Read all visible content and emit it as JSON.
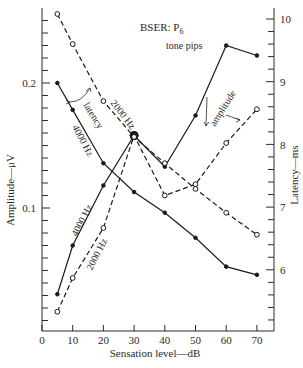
{
  "chart_data": {
    "type": "line",
    "title": "BSER: P6",
    "title_main": "BSER: P",
    "title_sub": "6",
    "subtitle": "tone pips",
    "xlabel": "Sensation level—dB",
    "ylabel_left": "Amplitude—μV",
    "ylabel_right": "Latency—ms",
    "x_ticks": [
      0,
      10,
      20,
      30,
      40,
      50,
      60,
      70
    ],
    "y_left_ticks_labeled": [
      "0.1",
      "0.2"
    ],
    "y_right_ticks_labeled": [
      "6",
      "7",
      "8",
      "9",
      "10"
    ],
    "xlim": [
      0,
      75
    ],
    "ylim_left": [
      0.0,
      0.25
    ],
    "ylim_right": [
      5.1,
      10.1
    ],
    "grid": false,
    "x": [
      5,
      10,
      20,
      30,
      40,
      50,
      60,
      70
    ],
    "series": [
      {
        "name": "4000 Hz amplitude",
        "axis": "left",
        "style": "solid, filled dots",
        "values": [
          0.031,
          0.07,
          0.118,
          0.158,
          0.133,
          0.174,
          0.23,
          0.222
        ]
      },
      {
        "name": "2000 Hz amplitude",
        "axis": "left",
        "style": "dashed, open circles",
        "values": [
          0.017,
          0.044,
          0.084,
          0.158,
          0.11,
          0.119,
          0.152,
          0.179
        ]
      },
      {
        "name": "4000 Hz latency",
        "axis": "right",
        "style": "solid, filled dots",
        "values": [
          8.98,
          8.55,
          7.7,
          7.24,
          6.91,
          6.51,
          6.05,
          5.92
        ]
      },
      {
        "name": "2000 Hz latency",
        "axis": "right",
        "style": "dashed, open circles",
        "values": [
          10.08,
          9.6,
          8.69,
          8.12,
          7.7,
          7.29,
          6.91,
          6.56
        ]
      }
    ],
    "annotations": [
      {
        "text": "latency",
        "points_to": "latency curves"
      },
      {
        "text": "amplitude",
        "points_to": "amplitude curves"
      },
      {
        "text": "2000 Hz",
        "near": "2000 Hz latency"
      },
      {
        "text": "4000 Hz",
        "near": "4000 Hz latency"
      },
      {
        "text": "4000 Hz",
        "near": "4000 Hz amplitude"
      },
      {
        "text": "2000 Hz",
        "near": "2000 Hz amplitude"
      }
    ]
  }
}
